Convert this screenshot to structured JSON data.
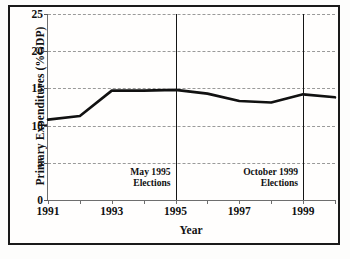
{
  "chart_data": {
    "type": "line",
    "title": "",
    "xlabel": "Year",
    "ylabel": "Primary Expenditures (%GDP)",
    "xlim": [
      1991,
      2000
    ],
    "ylim": [
      0,
      25
    ],
    "grid": true,
    "legend": "none",
    "line_color": "#111111",
    "x": [
      1991,
      1992,
      1993,
      1994,
      1995,
      1996,
      1997,
      1998,
      1999,
      2000
    ],
    "xtick_labels": [
      "1991",
      "1993",
      "1995",
      "1997",
      "1999"
    ],
    "xtick_values": [
      1991,
      1993,
      1995,
      1997,
      1999
    ],
    "ytick_labels": [
      "0",
      "5",
      "10",
      "15",
      "20",
      "25"
    ],
    "ytick_values": [
      0,
      5,
      10,
      15,
      20,
      25
    ],
    "series": [
      {
        "name": "Primary Expenditures",
        "values": [
          10.8,
          11.3,
          14.7,
          14.7,
          14.8,
          14.3,
          13.3,
          13.1,
          14.2,
          13.8
        ]
      }
    ],
    "annotations": [
      {
        "id": "may-1995-elections",
        "x": 1995,
        "line1": "May 1995",
        "line2": "Elections"
      },
      {
        "id": "october-1999-elections",
        "x": 1999,
        "line1": "October 1999",
        "line2": "Elections"
      }
    ]
  }
}
